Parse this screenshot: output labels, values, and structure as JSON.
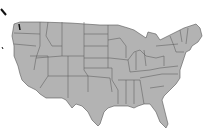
{
  "map": {
    "subject": "United States states outline map",
    "fill_color": "#b3b3b3",
    "border_color": "#555555",
    "background_color": "#ffffff"
  }
}
